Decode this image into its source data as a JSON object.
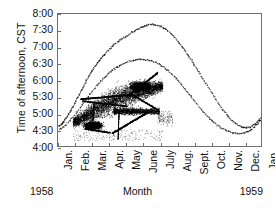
{
  "chart_data": {
    "type": "scatter",
    "title": "",
    "xlabel": "Month",
    "ylabel": "Time of afternoon, CST",
    "xtick_labels": [
      "Jan.",
      "Feb.",
      "Mar.",
      "Apr.",
      "May",
      "June",
      "July",
      "Aug.",
      "Sept.",
      "Oct.",
      "Nov.",
      "Dec.",
      "Jan."
    ],
    "ytick_labels": [
      "8:00",
      "7:30",
      "7:00",
      "6:30",
      "6:00",
      "5:30",
      "5:00",
      "4:30",
      "4:00"
    ],
    "ylim_hours": [
      4.0,
      8.0
    ],
    "xlim_months": [
      0,
      12
    ],
    "grid": false,
    "legend": null,
    "year_left": "1958",
    "year_right": "1959",
    "series": [
      {
        "name": "sunset-envelope-upper",
        "comment": "Sparse upper scatter band tracing the seasonal sunset curve",
        "points": [
          [
            0.05,
            4.62
          ],
          [
            0.1,
            4.6
          ],
          [
            0.16,
            4.63
          ],
          [
            0.22,
            4.66
          ],
          [
            0.28,
            4.7
          ],
          [
            0.34,
            4.74
          ],
          [
            0.42,
            4.8
          ],
          [
            0.5,
            4.86
          ],
          [
            0.58,
            4.92
          ],
          [
            0.66,
            4.99
          ],
          [
            0.74,
            5.06
          ],
          [
            0.82,
            5.13
          ],
          [
            0.9,
            5.2
          ],
          [
            0.98,
            5.28
          ],
          [
            1.06,
            5.36
          ],
          [
            1.14,
            5.44
          ],
          [
            1.22,
            5.52
          ],
          [
            1.3,
            5.6
          ],
          [
            1.38,
            5.68
          ],
          [
            1.46,
            5.76
          ],
          [
            1.54,
            5.84
          ],
          [
            1.62,
            5.92
          ],
          [
            1.7,
            6.0
          ],
          [
            1.78,
            6.07
          ],
          [
            1.86,
            6.14
          ],
          [
            1.94,
            6.21
          ],
          [
            2.02,
            6.28
          ],
          [
            2.1,
            6.34
          ],
          [
            2.18,
            6.4
          ],
          [
            2.26,
            6.46
          ],
          [
            2.34,
            6.52
          ],
          [
            2.42,
            6.57
          ],
          [
            2.5,
            6.62
          ],
          [
            2.58,
            6.67
          ],
          [
            2.66,
            6.72
          ],
          [
            2.74,
            6.77
          ],
          [
            2.86,
            6.83
          ],
          [
            2.98,
            6.9
          ],
          [
            3.1,
            6.96
          ],
          [
            3.22,
            7.02
          ],
          [
            3.34,
            7.07
          ],
          [
            3.46,
            7.12
          ],
          [
            3.58,
            7.17
          ],
          [
            3.7,
            7.21
          ],
          [
            3.82,
            7.25
          ],
          [
            3.94,
            7.29
          ],
          [
            4.06,
            7.33
          ],
          [
            4.18,
            7.37
          ],
          [
            4.3,
            7.41
          ],
          [
            4.42,
            7.45
          ],
          [
            4.54,
            7.49
          ],
          [
            4.66,
            7.53
          ],
          [
            4.78,
            7.56
          ],
          [
            4.9,
            7.59
          ],
          [
            5.02,
            7.62
          ],
          [
            5.14,
            7.64
          ],
          [
            5.26,
            7.66
          ],
          [
            5.38,
            7.67
          ],
          [
            5.5,
            7.68
          ],
          [
            5.62,
            7.68
          ],
          [
            5.74,
            7.67
          ],
          [
            5.86,
            7.66
          ],
          [
            5.98,
            7.64
          ],
          [
            6.1,
            7.62
          ],
          [
            6.22,
            7.59
          ],
          [
            6.34,
            7.55
          ],
          [
            6.46,
            7.5
          ],
          [
            6.58,
            7.45
          ],
          [
            6.7,
            7.39
          ],
          [
            6.82,
            7.33
          ],
          [
            6.94,
            7.26
          ],
          [
            7.06,
            7.19
          ],
          [
            7.18,
            7.11
          ],
          [
            7.3,
            7.03
          ],
          [
            7.42,
            6.95
          ],
          [
            7.54,
            6.86
          ],
          [
            7.66,
            6.77
          ],
          [
            7.78,
            6.68
          ],
          [
            7.9,
            6.59
          ],
          [
            8.02,
            6.5
          ],
          [
            8.14,
            6.4
          ],
          [
            8.26,
            6.3
          ],
          [
            8.38,
            6.2
          ],
          [
            8.5,
            6.1
          ],
          [
            8.62,
            6.0
          ],
          [
            8.74,
            5.9
          ],
          [
            8.86,
            5.8
          ],
          [
            8.98,
            5.7
          ],
          [
            9.1,
            5.6
          ],
          [
            9.22,
            5.5
          ],
          [
            9.34,
            5.4
          ],
          [
            9.46,
            5.31
          ],
          [
            9.58,
            5.22
          ],
          [
            9.7,
            5.13
          ],
          [
            9.82,
            5.05
          ],
          [
            9.94,
            4.97
          ],
          [
            10.06,
            4.9
          ],
          [
            10.18,
            4.83
          ],
          [
            10.3,
            4.77
          ],
          [
            10.42,
            4.72
          ],
          [
            10.54,
            4.67
          ],
          [
            10.66,
            4.63
          ],
          [
            10.78,
            4.6
          ],
          [
            10.9,
            4.57
          ],
          [
            11.02,
            4.56
          ],
          [
            11.14,
            4.55
          ],
          [
            11.26,
            4.56
          ],
          [
            11.38,
            4.58
          ],
          [
            11.5,
            4.61
          ],
          [
            11.62,
            4.65
          ],
          [
            11.74,
            4.7
          ],
          [
            11.86,
            4.76
          ],
          [
            11.94,
            4.82
          ],
          [
            12.0,
            4.88
          ]
        ]
      },
      {
        "name": "sunset-envelope-lower",
        "comment": "Second sparse strand running just below the upper band",
        "points": [
          [
            0.08,
            4.5
          ],
          [
            0.18,
            4.53
          ],
          [
            0.3,
            4.57
          ],
          [
            0.44,
            4.63
          ],
          [
            0.58,
            4.7
          ],
          [
            0.72,
            4.78
          ],
          [
            0.86,
            4.86
          ],
          [
            1.0,
            4.95
          ],
          [
            1.14,
            5.04
          ],
          [
            1.28,
            5.14
          ],
          [
            1.42,
            5.24
          ],
          [
            1.56,
            5.34
          ],
          [
            1.7,
            5.44
          ],
          [
            1.84,
            5.54
          ],
          [
            1.98,
            5.63
          ],
          [
            2.12,
            5.72
          ],
          [
            2.26,
            5.81
          ],
          [
            2.4,
            5.89
          ],
          [
            2.54,
            5.97
          ],
          [
            2.68,
            6.04
          ],
          [
            2.82,
            6.11
          ],
          [
            2.96,
            6.18
          ],
          [
            3.1,
            6.24
          ],
          [
            3.24,
            6.3
          ],
          [
            3.38,
            6.35
          ],
          [
            3.52,
            6.4
          ],
          [
            3.66,
            6.44
          ],
          [
            3.8,
            6.48
          ],
          [
            3.94,
            6.51
          ],
          [
            4.08,
            6.54
          ],
          [
            4.22,
            6.56
          ],
          [
            4.36,
            6.58
          ],
          [
            4.5,
            6.6
          ],
          [
            4.64,
            6.61
          ],
          [
            4.78,
            6.62
          ],
          [
            4.92,
            6.62
          ],
          [
            5.06,
            6.62
          ],
          [
            5.2,
            6.61
          ],
          [
            5.34,
            6.6
          ],
          [
            5.48,
            6.58
          ],
          [
            5.62,
            6.56
          ],
          [
            5.76,
            6.53
          ],
          [
            5.9,
            6.5
          ],
          [
            6.04,
            6.46
          ],
          [
            6.18,
            6.41
          ],
          [
            6.32,
            6.36
          ],
          [
            6.46,
            6.3
          ],
          [
            6.6,
            6.24
          ],
          [
            6.74,
            6.17
          ],
          [
            6.88,
            6.1
          ],
          [
            7.02,
            6.02
          ],
          [
            7.16,
            5.94
          ],
          [
            7.3,
            5.86
          ],
          [
            7.44,
            5.77
          ],
          [
            7.58,
            5.68
          ],
          [
            7.72,
            5.59
          ],
          [
            7.86,
            5.5
          ],
          [
            8.0,
            5.41
          ],
          [
            8.14,
            5.32
          ],
          [
            8.28,
            5.23
          ],
          [
            8.42,
            5.14
          ],
          [
            8.56,
            5.06
          ],
          [
            8.7,
            4.98
          ],
          [
            8.84,
            4.9
          ],
          [
            8.98,
            4.83
          ],
          [
            9.12,
            4.76
          ],
          [
            9.26,
            4.7
          ],
          [
            9.4,
            4.64
          ],
          [
            9.54,
            4.59
          ],
          [
            9.68,
            4.54
          ],
          [
            9.82,
            4.5
          ],
          [
            9.96,
            4.47
          ],
          [
            10.1,
            4.44
          ],
          [
            10.24,
            4.42
          ],
          [
            10.38,
            4.4
          ],
          [
            10.52,
            4.39
          ],
          [
            10.66,
            4.38
          ],
          [
            10.8,
            4.38
          ],
          [
            10.94,
            4.39
          ],
          [
            11.08,
            4.41
          ],
          [
            11.22,
            4.44
          ],
          [
            11.36,
            4.48
          ],
          [
            11.5,
            4.53
          ],
          [
            11.64,
            4.59
          ],
          [
            11.78,
            4.66
          ],
          [
            11.92,
            4.74
          ],
          [
            12.0,
            4.8
          ]
        ]
      },
      {
        "name": "dense-roost-cluster",
        "comment": "Large dark cluster of observations, roughly Feb through early July, 4:10-6:20",
        "bounds_months": [
          0.9,
          6.2
        ],
        "bounds_hours": [
          4.1,
          6.3
        ],
        "peak_density_months": [
          4.6,
          5.9
        ],
        "peak_density_hours": [
          5.6,
          6.2
        ]
      }
    ]
  }
}
